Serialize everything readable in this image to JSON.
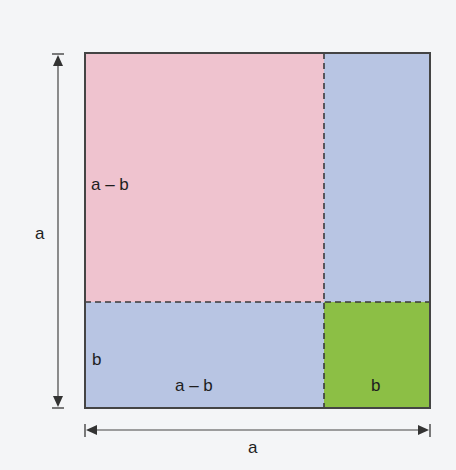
{
  "diagram": {
    "square": {
      "x": 85,
      "y": 53,
      "size": 345,
      "split_x": 324,
      "split_y": 302
    },
    "regions": [
      {
        "name": "top-left-square",
        "label": "a – b",
        "color": "#efc3cf"
      },
      {
        "name": "top-right-rect",
        "label": "",
        "color": "#b8c5e3"
      },
      {
        "name": "bottom-left-rect",
        "label": "a – b",
        "color": "#b8c5e3"
      },
      {
        "name": "bottom-right-square",
        "label": "b",
        "color": "#8cbf45"
      }
    ],
    "labels": {
      "top_left_side": "a – b",
      "bottom_left_side": "b",
      "bottom_left_width": "a – b",
      "bottom_right_width": "b",
      "vertical_dimension": "a",
      "horizontal_dimension": "a"
    },
    "colors": {
      "border": "#444444",
      "dash": "#3a3a3a",
      "arrow": "#444444",
      "background": "#f4f5f7"
    }
  }
}
